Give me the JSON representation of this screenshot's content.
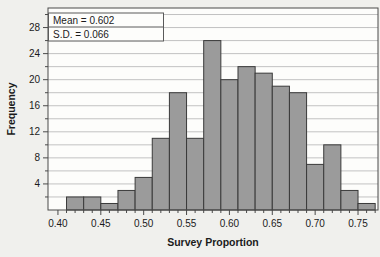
{
  "figure": {
    "kind": "histogram-screenshot",
    "stats_box": {
      "line1": "Mean = 0.602",
      "line2": "S.D. = 0.066"
    }
  },
  "chart_data": {
    "type": "bar",
    "subtype": "histogram",
    "title": "",
    "xlabel": "Survey Proportion",
    "ylabel": "Frequency",
    "bin_start": 0.41,
    "bin_width": 0.02,
    "bin_edges": [
      0.41,
      0.43,
      0.45,
      0.47,
      0.49,
      0.51,
      0.53,
      0.55,
      0.57,
      0.59,
      0.61,
      0.63,
      0.65,
      0.67,
      0.69,
      0.71,
      0.73,
      0.75,
      0.77
    ],
    "counts": [
      2,
      2,
      1,
      3,
      5,
      11,
      18,
      11,
      26,
      20,
      22,
      21,
      19,
      18,
      7,
      10,
      3,
      1
    ],
    "n_total": 200,
    "annotations": [
      "Mean = 0.602",
      "S.D. = 0.066"
    ],
    "x_major_ticks": [
      0.4,
      0.45,
      0.5,
      0.55,
      0.6,
      0.65,
      0.7,
      0.75
    ],
    "x_major_tick_labels": [
      "0.40",
      "0.45",
      "0.50",
      "0.55",
      "0.60",
      "0.65",
      "0.70",
      "0.75"
    ],
    "x_minor_step": 0.01,
    "y_major_ticks": [
      4,
      8,
      12,
      16,
      20,
      24,
      28
    ],
    "y_minor_step": 2,
    "grid_step": 2,
    "grid_on": true,
    "xlim": [
      0.3884,
      0.7733
    ],
    "ylim": [
      0,
      31
    ],
    "colors": {
      "bar_fill": "#9b9b9b",
      "bar_stroke": "#3a3a3a",
      "grid": "#c2c2c2",
      "frame": "#4a4a4a",
      "plot_bg": "#fdfdfb",
      "outer_bg": "#f0f0ed",
      "text": "#1b1b1b",
      "stats_box_border": "#5a5a5a",
      "stats_box_bg": "#fdfdfb"
    }
  }
}
